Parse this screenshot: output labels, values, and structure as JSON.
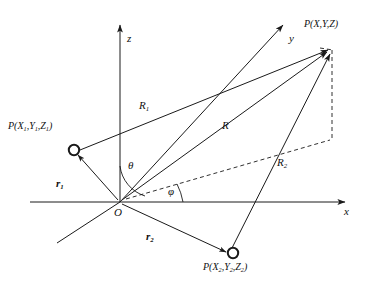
{
  "figure": {
    "type": "vector-geometry-diagram",
    "stroke_color": "#1a1a1a",
    "background_color": "#ffffff"
  },
  "axes": {
    "z": {
      "label": "z"
    },
    "y": {
      "label": "y"
    },
    "x": {
      "label": "x"
    },
    "origin": {
      "label": "O"
    }
  },
  "angles": {
    "theta": {
      "label": "θ"
    },
    "phi": {
      "label": "φ"
    }
  },
  "points": {
    "field": {
      "name": "P",
      "coords": "(X,Y,Z)",
      "label_p": "P",
      "label_open": "(",
      "label_x": "X",
      "label_sep1": ",",
      "label_y": "Y",
      "label_sep2": ",",
      "label_z": "Z",
      "label_close": ")"
    },
    "source1": {
      "name": "P",
      "coords": "(X₁,Y₁,Z₁)",
      "subscript": "1"
    },
    "source2": {
      "name": "P",
      "coords": "(X₂,Y₂,Z₂)",
      "subscript": "2"
    }
  },
  "vectors": {
    "r1": {
      "base": "r",
      "subscript": "1"
    },
    "r2": {
      "base": "r",
      "subscript": "2"
    },
    "R1": {
      "base": "R",
      "subscript": "1"
    },
    "R": {
      "base": "R",
      "subscript": ""
    },
    "R2": {
      "base": "R",
      "subscript": "2"
    }
  }
}
